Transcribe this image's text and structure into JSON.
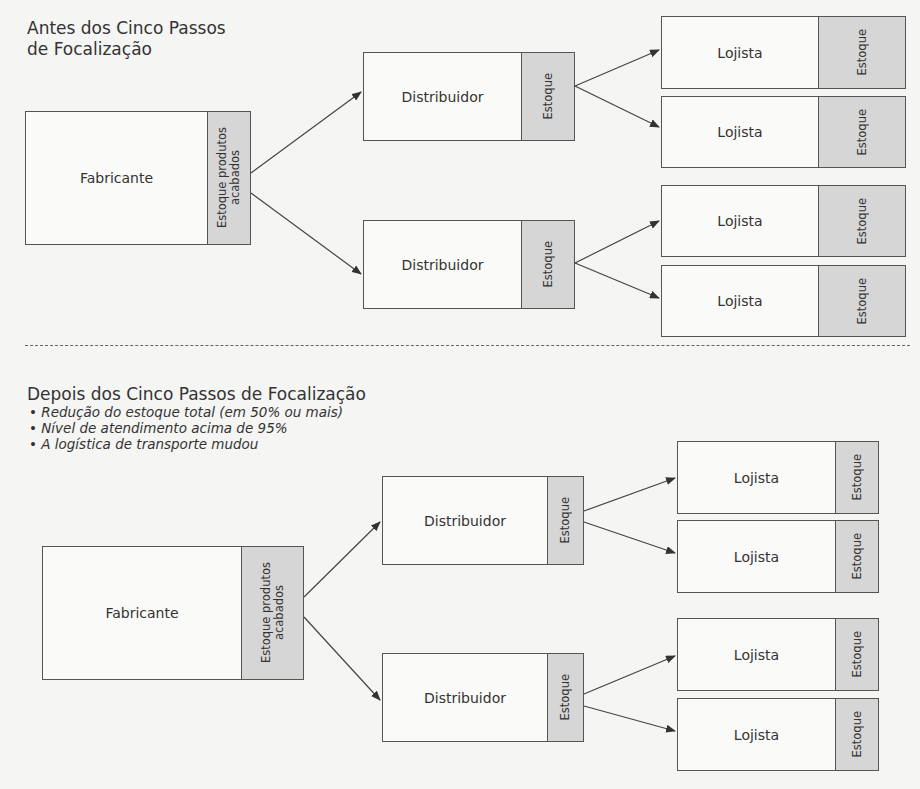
{
  "before": {
    "title_line1": "Antes dos Cinco Passos",
    "title_line2": "de Focalização",
    "manufacturer": {
      "label": "Fabricante",
      "stock": "Estoque produtos\nacabados"
    },
    "distributors": [
      {
        "label": "Distribuidor",
        "stock": "Estoque"
      },
      {
        "label": "Distribuidor",
        "stock": "Estoque"
      }
    ],
    "retailers": [
      {
        "label": "Lojista",
        "stock": "Estoque"
      },
      {
        "label": "Lojista",
        "stock": "Estoque"
      },
      {
        "label": "Lojista",
        "stock": "Estoque"
      },
      {
        "label": "Lojista",
        "stock": "Estoque"
      }
    ]
  },
  "after": {
    "title": "Depois dos Cinco Passos de Focalização",
    "bullets": [
      "• Redução do estoque total (em 50% ou mais)",
      "• Nível de atendimento acima de 95%",
      "• A logística de transporte mudou"
    ],
    "manufacturer": {
      "label": "Fabricante",
      "stock": "Estoque produtos\nacabados"
    },
    "distributors": [
      {
        "label": "Distribuidor",
        "stock": "Estoque"
      },
      {
        "label": "Distribuidor",
        "stock": "Estoque"
      }
    ],
    "retailers": [
      {
        "label": "Lojista",
        "stock": "Estoque"
      },
      {
        "label": "Lojista",
        "stock": "Estoque"
      },
      {
        "label": "Lojista",
        "stock": "Estoque"
      },
      {
        "label": "Lojista",
        "stock": "Estoque"
      }
    ]
  },
  "colors": {
    "box_border": "#555555",
    "stock_fill": "#d6d6d6",
    "background": "#f5f5f3"
  }
}
